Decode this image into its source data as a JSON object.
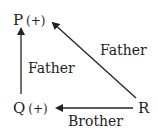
{
  "nodes": {
    "P": {
      "name": "P",
      "sign": "(+)"
    },
    "Q": {
      "name": "Q",
      "sign": "(+)"
    },
    "R": {
      "name": "R"
    }
  },
  "edges": [
    {
      "from": "Q",
      "to": "P",
      "label": "Father"
    },
    {
      "from": "R",
      "to": "P",
      "label": "Father"
    },
    {
      "from": "R",
      "to": "Q",
      "label": "Brother"
    }
  ]
}
